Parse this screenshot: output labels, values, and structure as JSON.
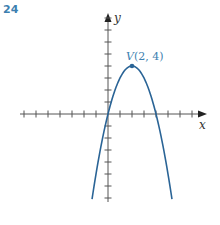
{
  "problem_number": "24",
  "colors": {
    "curve": "#2a6496",
    "label": "#3d7fb0",
    "axis": "#555555"
  },
  "chart_data": {
    "type": "line",
    "title": "",
    "function": "y = -(x - 2)^2 + 4",
    "xlabel": "x",
    "ylabel": "y",
    "xlim": [
      -7,
      7
    ],
    "ylim": [
      -7,
      8
    ],
    "grid": false,
    "tick_spacing": 1,
    "tick_labels": false,
    "annotations": [
      {
        "text": "V(2, 4)",
        "x": 2,
        "y": 4,
        "marker": "point"
      }
    ],
    "series": [
      {
        "name": "parabola",
        "x": [
          -1.33,
          -1,
          0,
          1,
          2,
          3,
          4,
          5,
          5.33
        ],
        "y": [
          -7.1,
          -5,
          0,
          3,
          4,
          3,
          0,
          -5,
          -7.1
        ]
      }
    ]
  },
  "labels": {
    "x_axis": "x",
    "y_axis": "y",
    "vertex_name": "V",
    "vertex_coords": "(2, 4)"
  }
}
